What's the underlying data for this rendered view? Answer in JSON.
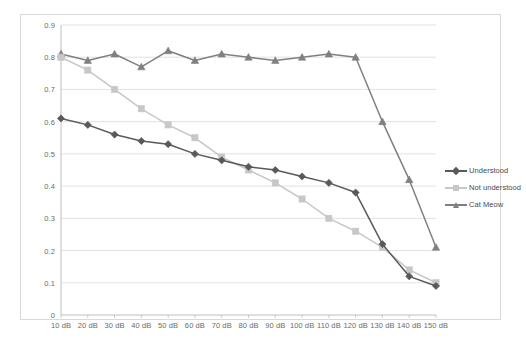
{
  "chart_data": {
    "type": "line",
    "title": "",
    "xlabel": "",
    "ylabel": "",
    "ylim": [
      0,
      0.9
    ],
    "ytick_labels": [
      "0.9",
      "0.8",
      "0.7",
      "0.6",
      "0.5",
      "0.4",
      "0.3",
      "0.2",
      "0.1",
      "0"
    ],
    "ytick_values": [
      0.9,
      0.8,
      0.7,
      0.6,
      0.5,
      0.4,
      0.3,
      0.2,
      0.1,
      0
    ],
    "grid": true,
    "legend_position": "right",
    "categories": [
      "10 dB",
      "20 dB",
      "30 dB",
      "40 dB",
      "50 dB",
      "60 dB",
      "70 dB",
      "80 dB",
      "90 dB",
      "100 dB",
      "110 dB",
      "120 dB",
      "130 dB",
      "140 dB",
      "150 dB"
    ],
    "series": [
      {
        "name": "Understood",
        "color": "#595959",
        "marker": "diamond",
        "values": [
          0.61,
          0.59,
          0.56,
          0.54,
          0.53,
          0.5,
          0.48,
          0.46,
          0.45,
          0.43,
          0.41,
          0.38,
          0.22,
          0.12,
          0.09
        ]
      },
      {
        "name": "Not understood",
        "color": "#c7c7c7",
        "marker": "square",
        "values": [
          0.8,
          0.76,
          0.7,
          0.64,
          0.59,
          0.55,
          0.49,
          0.45,
          0.41,
          0.36,
          0.3,
          0.26,
          0.21,
          0.14,
          0.1
        ]
      },
      {
        "name": "Cat Meow",
        "color": "#808080",
        "marker": "triangle",
        "values": [
          0.81,
          0.79,
          0.81,
          0.77,
          0.82,
          0.79,
          0.81,
          0.8,
          0.79,
          0.8,
          0.81,
          0.8,
          0.6,
          0.42,
          0.21
        ]
      }
    ]
  },
  "legend": {
    "items": [
      {
        "label": "Understood",
        "color": "#595959"
      },
      {
        "label": "Not understood",
        "color": "#c7c7c7"
      },
      {
        "label": "Cat Meow",
        "color": "#808080"
      }
    ]
  },
  "colors": {
    "gridline": "#d6d6d6",
    "axis": "#bfbfbf",
    "tick_text": "#6b6b6b",
    "frame_border": "#d9d9d9",
    "background": "#ffffff"
  }
}
